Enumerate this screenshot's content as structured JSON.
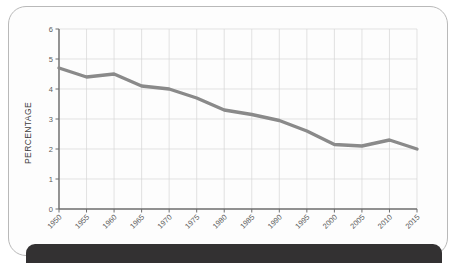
{
  "chart_data": {
    "type": "line",
    "title": "",
    "xlabel": "",
    "ylabel": "PERCENTAGE",
    "categories": [
      "1950",
      "1955",
      "1960",
      "1965",
      "1970",
      "1975",
      "1980",
      "1985",
      "1990",
      "1995",
      "2000",
      "2005",
      "2010",
      "2015"
    ],
    "values": [
      4.7,
      4.4,
      4.5,
      4.1,
      4.0,
      3.7,
      3.3,
      3.15,
      2.95,
      2.6,
      2.15,
      2.1,
      2.3,
      2.0
    ],
    "series": [
      {
        "name": "Percentage",
        "values": [
          4.7,
          4.4,
          4.5,
          4.1,
          4.0,
          3.7,
          3.3,
          3.15,
          2.95,
          2.6,
          2.15,
          2.1,
          2.3,
          2.0
        ]
      }
    ],
    "ylim": [
      0,
      6
    ],
    "yticks": [
      "0",
      "1",
      "2",
      "3",
      "4",
      "5",
      "6"
    ],
    "xticks": [
      "1950",
      "1955",
      "1960",
      "1965",
      "1970",
      "1975",
      "1980",
      "1985",
      "1990",
      "1995",
      "2000",
      "2005",
      "2010",
      "2015"
    ],
    "grid": true,
    "legend": false,
    "line_color": "#8a8a8a",
    "grid_color": "#d6d6d6",
    "axis_color": "#6d6d6d"
  },
  "card": {
    "background_color": "#fdfdfd",
    "border_color": "#b9b9b9"
  },
  "bottom_bar": {
    "color": "#333132"
  }
}
